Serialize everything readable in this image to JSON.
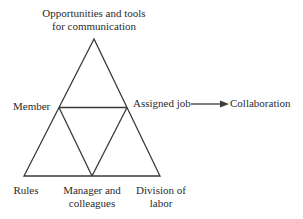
{
  "diagram": {
    "title_node": "Opportunities and tools\nfor communication",
    "left_node": "Member",
    "right_node": "Assigned job",
    "outcome_node": "Collaboration",
    "bottom_left_node": "Rules",
    "bottom_center_node": "Manager and\ncolleagues",
    "bottom_right_node": "Division of\nlabor",
    "relationship": {
      "from": "Assigned job",
      "to": "Collaboration",
      "connector": "arrow-right"
    },
    "colors": {
      "line": "#3a3a3a",
      "text": "#2b2b2b",
      "background": "#ffffff"
    }
  }
}
